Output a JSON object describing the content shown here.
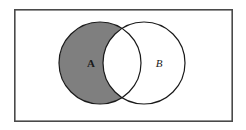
{
  "figure": {
    "name": "venn-diagram-a-minus-b",
    "caption": "",
    "universe_label": "",
    "background_color": "#ffffff"
  },
  "chart_data": {
    "type": "diagram",
    "diagram_kind": "venn",
    "title": "",
    "sets": [
      {
        "id": "A",
        "label": "A",
        "shaded": true,
        "fill_color": "#7f7f7f",
        "stroke_color": "#1a1a1a",
        "center_x": 100,
        "center_y": 63,
        "radius": 41,
        "label_x": 91,
        "label_y": 63,
        "label_style": "bold-serif"
      },
      {
        "id": "B",
        "label": "B",
        "shaded": false,
        "fill_color": "#ffffff",
        "stroke_color": "#1a1a1a",
        "center_x": 144,
        "center_y": 63,
        "radius": 41,
        "label_x": 159,
        "label_y": 63,
        "label_style": "italic-serif"
      }
    ],
    "shaded_region": "A \\ B",
    "shaded_region_description": "A minus B (A without the intersection)",
    "intersection": {
      "shaded": false,
      "fill_color": "#ffffff",
      "top_point_x": 124,
      "top_point_y": 33,
      "bottom_point_x": 124,
      "bottom_point_y": 94
    },
    "universe": {
      "label": "",
      "shape": "rectangle",
      "x": 14,
      "y": 9,
      "width": 219,
      "height": 113,
      "fill_color": "#ffffff",
      "stroke_color": "#4a4a4a",
      "stroke_width": 1.6
    }
  },
  "colors": {
    "shade_gray": "#7f7f7f",
    "outline_dark": "#1a1a1a",
    "frame_gray": "#4a4a4a",
    "paper_white": "#ffffff"
  }
}
